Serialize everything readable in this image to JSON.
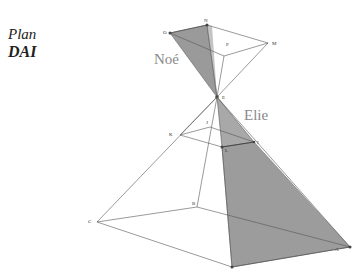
{
  "title": {
    "line1": "Plan",
    "line2": "DAI"
  },
  "figure_labels": {
    "upper": "Noé",
    "lower": "Elie"
  },
  "points": {
    "O": "O",
    "N": "N",
    "M": "M",
    "P": "P",
    "E": "E",
    "K": "K",
    "J": "J",
    "L": "L",
    "I": "I",
    "C": "C",
    "B": "B",
    "A": "A"
  },
  "colors": {
    "line": "#555555",
    "shade": "#9a9a9a",
    "shade_dark": "#7c7c7c",
    "label": "#8a8a8a"
  }
}
